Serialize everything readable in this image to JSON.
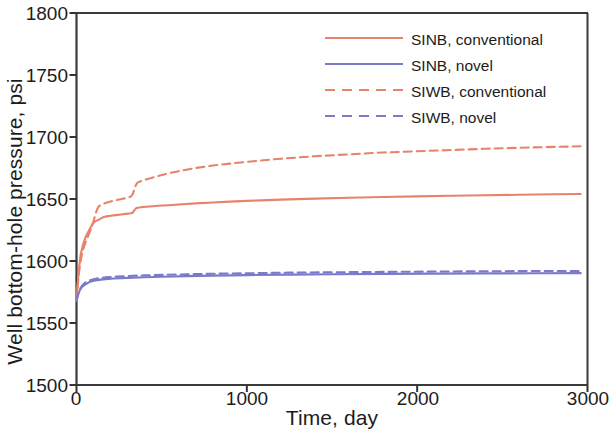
{
  "chart_data": {
    "type": "line",
    "title": "",
    "xlabel": "Time, day",
    "ylabel": "Well bottom-hole pressure, psi",
    "xlim": [
      0,
      3000
    ],
    "ylim": [
      1500,
      1800
    ],
    "xticks": [
      0,
      1000,
      2000,
      3000
    ],
    "yticks": [
      1500,
      1550,
      1600,
      1650,
      1700,
      1750,
      1800
    ],
    "grid": false,
    "legend_position": "top-right",
    "colors": {
      "conventional": "#e8826a",
      "novel": "#7b79c9",
      "axis": "#333333"
    },
    "series": [
      {
        "name": "SINB, conventional",
        "color": "#e8826a",
        "style": "solid",
        "points": [
          [
            0,
            1568
          ],
          [
            6,
            1580
          ],
          [
            14,
            1593
          ],
          [
            24,
            1605
          ],
          [
            38,
            1613
          ],
          [
            55,
            1620
          ],
          [
            75,
            1625
          ],
          [
            95,
            1630
          ],
          [
            110,
            1632
          ],
          [
            125,
            1633
          ],
          [
            140,
            1634
          ],
          [
            152,
            1635
          ],
          [
            160,
            1635.5
          ],
          [
            175,
            1636
          ],
          [
            200,
            1636.5
          ],
          [
            230,
            1637
          ],
          [
            260,
            1637.5
          ],
          [
            290,
            1638
          ],
          [
            320,
            1638.5
          ],
          [
            330,
            1639
          ],
          [
            340,
            1641
          ],
          [
            350,
            1642.5
          ],
          [
            360,
            1643
          ],
          [
            390,
            1643.5
          ],
          [
            430,
            1644
          ],
          [
            480,
            1644.5
          ],
          [
            540,
            1645
          ],
          [
            620,
            1645.8
          ],
          [
            700,
            1646.5
          ],
          [
            800,
            1647.2
          ],
          [
            900,
            1647.9
          ],
          [
            1000,
            1648.5
          ],
          [
            1200,
            1649.5
          ],
          [
            1400,
            1650.3
          ],
          [
            1600,
            1651
          ],
          [
            1800,
            1651.6
          ],
          [
            2000,
            1652.1
          ],
          [
            2200,
            1652.6
          ],
          [
            2400,
            1653
          ],
          [
            2600,
            1653.4
          ],
          [
            2800,
            1653.8
          ],
          [
            2960,
            1654
          ]
        ]
      },
      {
        "name": "SINB, novel",
        "color": "#7b79c9",
        "style": "solid",
        "points": [
          [
            0,
            1568
          ],
          [
            8,
            1572
          ],
          [
            18,
            1576
          ],
          [
            32,
            1579
          ],
          [
            50,
            1581
          ],
          [
            75,
            1583
          ],
          [
            100,
            1584
          ],
          [
            130,
            1584.8
          ],
          [
            170,
            1585.4
          ],
          [
            220,
            1585.9
          ],
          [
            300,
            1586.4
          ],
          [
            400,
            1586.9
          ],
          [
            500,
            1587.3
          ],
          [
            650,
            1587.8
          ],
          [
            800,
            1588.2
          ],
          [
            1000,
            1588.6
          ],
          [
            1250,
            1589
          ],
          [
            1500,
            1589.3
          ],
          [
            1800,
            1589.6
          ],
          [
            2100,
            1589.8
          ],
          [
            2400,
            1590
          ],
          [
            2700,
            1590.1
          ],
          [
            2960,
            1590.2
          ]
        ]
      },
      {
        "name": "SIWB, conventional",
        "color": "#e8826a",
        "style": "dashed",
        "points": [
          [
            0,
            1568
          ],
          [
            6,
            1578
          ],
          [
            14,
            1590
          ],
          [
            24,
            1600
          ],
          [
            36,
            1608
          ],
          [
            50,
            1614
          ],
          [
            68,
            1620
          ],
          [
            85,
            1626
          ],
          [
            100,
            1632
          ],
          [
            112,
            1638
          ],
          [
            122,
            1642
          ],
          [
            130,
            1644
          ],
          [
            140,
            1645
          ],
          [
            155,
            1646
          ],
          [
            175,
            1647
          ],
          [
            200,
            1648
          ],
          [
            230,
            1649
          ],
          [
            265,
            1650
          ],
          [
            300,
            1651
          ],
          [
            320,
            1652
          ],
          [
            330,
            1654
          ],
          [
            340,
            1658
          ],
          [
            348,
            1661
          ],
          [
            356,
            1663
          ],
          [
            370,
            1664
          ],
          [
            400,
            1665.5
          ],
          [
            440,
            1667
          ],
          [
            490,
            1669
          ],
          [
            550,
            1671
          ],
          [
            620,
            1673
          ],
          [
            700,
            1675
          ],
          [
            800,
            1677
          ],
          [
            900,
            1678.5
          ],
          [
            1000,
            1680
          ],
          [
            1200,
            1682.5
          ],
          [
            1400,
            1684.5
          ],
          [
            1600,
            1686
          ],
          [
            1800,
            1687.5
          ],
          [
            2000,
            1688.5
          ],
          [
            2200,
            1689.5
          ],
          [
            2400,
            1690.5
          ],
          [
            2600,
            1691.3
          ],
          [
            2800,
            1692
          ],
          [
            2960,
            1692.5
          ]
        ]
      },
      {
        "name": "SIWB, novel",
        "color": "#7b79c9",
        "style": "dashed",
        "points": [
          [
            0,
            1568
          ],
          [
            8,
            1573
          ],
          [
            18,
            1577
          ],
          [
            32,
            1580
          ],
          [
            50,
            1582.5
          ],
          [
            75,
            1584.3
          ],
          [
            100,
            1585.3
          ],
          [
            130,
            1586.1
          ],
          [
            170,
            1586.8
          ],
          [
            220,
            1587.3
          ],
          [
            300,
            1587.9
          ],
          [
            400,
            1588.4
          ],
          [
            500,
            1588.8
          ],
          [
            650,
            1589.3
          ],
          [
            800,
            1589.7
          ],
          [
            1000,
            1590.1
          ],
          [
            1250,
            1590.6
          ],
          [
            1500,
            1590.9
          ],
          [
            1800,
            1591.2
          ],
          [
            2100,
            1591.5
          ],
          [
            2400,
            1591.7
          ],
          [
            2700,
            1591.9
          ],
          [
            2960,
            1592
          ]
        ]
      }
    ]
  },
  "axes": {
    "y_label": "Well bottom-hole pressure, psi",
    "x_label": "Time, day",
    "y_tick_labels": [
      "1800",
      "1750",
      "1700",
      "1650",
      "1600",
      "1550",
      "1500"
    ],
    "x_tick_labels": [
      "0",
      "1000",
      "2000",
      "3000"
    ]
  },
  "legend": {
    "entries": [
      {
        "label": "SINB, conventional",
        "color": "#e8826a",
        "style": "solid"
      },
      {
        "label": "SINB, novel",
        "color": "#7b79c9",
        "style": "solid"
      },
      {
        "label": "SIWB, conventional",
        "color": "#e8826a",
        "style": "dashed"
      },
      {
        "label": "SIWB, novel",
        "color": "#7b79c9",
        "style": "dashed"
      }
    ]
  }
}
